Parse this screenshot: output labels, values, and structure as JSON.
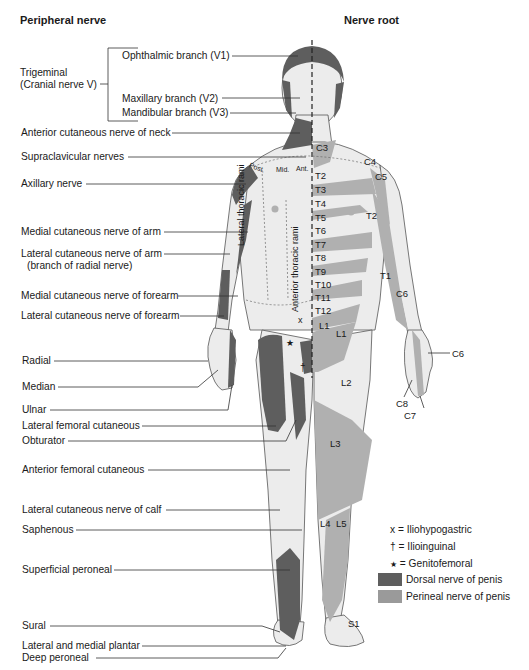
{
  "headers": {
    "left": "Peripheral nerve",
    "right": "Nerve root"
  },
  "peripheral_labels": {
    "trigeminal": "Trigeminal",
    "trigeminal_sub": "(Cranial nerve V)",
    "ophthalmic": "Ophthalmic branch (V1)",
    "maxillary": "Maxillary branch (V2)",
    "mandibular": "Mandibular branch (V3)",
    "ant_cut_neck": "Anterior cutaneous nerve of neck",
    "supraclavicular": "Supraclavicular nerves",
    "axillary": "Axillary nerve",
    "medial_cut_arm": "Medial cutaneous nerve of arm",
    "lateral_cut_arm": "Lateral cutaneous nerve of arm",
    "lateral_cut_arm_sub": "(branch of radial nerve)",
    "medial_cut_forearm": "Medial cutaneous nerve of forearm",
    "lateral_cut_forearm": "Lateral cutaneous nerve of forearm",
    "radial": "Radial",
    "median": "Median",
    "ulnar": "Ulnar",
    "lateral_femoral": "Lateral femoral cutaneous",
    "obturator": "Obturator",
    "anterior_femoral": "Anterior femoral cutaneous",
    "lateral_cut_calf": "Lateral cutaneous nerve of calf",
    "saphenous": "Saphenous",
    "superficial_peroneal": "Superficial peroneal",
    "sural": "Sural",
    "plantar": "Lateral and medial plantar",
    "deep_peroneal": "Deep peroneal"
  },
  "body_labels": {
    "post": "Post.",
    "mid": "Mid.",
    "ant": "Ant.",
    "lateral_thoracic_rami": "Lateral thoracic rami",
    "anterior_thoracic_rami": "Anterior thoracic rami",
    "x_mark": "x",
    "star_mark": "★",
    "dagger_mark": "†"
  },
  "root_labels": {
    "C3": "C3",
    "C4": "C4",
    "C5": "C5",
    "T2": "T2",
    "T3": "T3",
    "T4": "T4",
    "T5": "T5",
    "T6": "T6",
    "T7": "T7",
    "T8": "T8",
    "T9": "T9",
    "T10": "T10",
    "T11": "T11",
    "T12": "T12",
    "T2_arm": "T2",
    "T1": "T1",
    "C6_arm": "C6",
    "C6_hand": "C6",
    "C8": "C8",
    "C7": "C7",
    "L1": "L1",
    "L1b": "L1",
    "L2": "L2",
    "L3": "L3",
    "L4": "L4",
    "L5": "L5",
    "S1": "S1"
  },
  "legend": {
    "items": [
      {
        "symbol": "x",
        "text": "= Iliohypogastric"
      },
      {
        "symbol": "†",
        "text": "= Ilioinguinal"
      },
      {
        "symbol": "★",
        "text": "= Genitofemoral"
      }
    ],
    "swatches": [
      {
        "text": "Dorsal nerve of penis",
        "color": "#5e5e5e"
      },
      {
        "text": "Perineal nerve of penis",
        "color": "#9a9a9a"
      }
    ]
  },
  "colors": {
    "skin": "#ececec",
    "dark": "#5e5e5e",
    "medium": "#9a9a9a",
    "light_band": "#b4b4b4",
    "line": "#333333"
  }
}
